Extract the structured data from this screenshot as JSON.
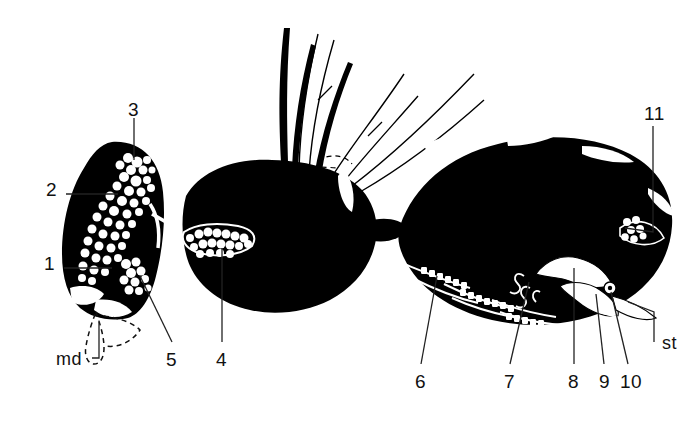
{
  "figure": {
    "background_color": "#ffffff",
    "ink_color": "#000000",
    "label_color": "#111111",
    "width": 698,
    "height": 425
  },
  "labels": [
    {
      "id": "label-1",
      "text": "1",
      "x": 44,
      "y": 262,
      "leader": "horizontal-right"
    },
    {
      "id": "label-2",
      "text": "2",
      "x": 46,
      "y": 188,
      "leader": "horizontal-right"
    },
    {
      "id": "label-3",
      "text": "3",
      "x": 128,
      "y": 106,
      "leader": "vertical-down"
    },
    {
      "id": "label-4",
      "text": "4",
      "x": 216,
      "y": 358,
      "leader": "vertical-up"
    },
    {
      "id": "label-5",
      "text": "5",
      "x": 166,
      "y": 358,
      "leader": "diagonal-up-right"
    },
    {
      "id": "label-6",
      "text": "6",
      "x": 415,
      "y": 380,
      "leader": "diagonal-up-right"
    },
    {
      "id": "label-7",
      "text": "7",
      "x": 504,
      "y": 380,
      "leader": "diagonal-up-right"
    },
    {
      "id": "label-8",
      "text": "8",
      "x": 568,
      "y": 380,
      "leader": "vertical-up"
    },
    {
      "id": "label-9",
      "text": "9",
      "x": 600,
      "y": 380,
      "leader": "vertical-up"
    },
    {
      "id": "label-10",
      "text": "10",
      "x": 620,
      "y": 380,
      "leader": "vertical-up"
    },
    {
      "id": "label-11",
      "text": "11",
      "x": 645,
      "y": 108,
      "leader": "bent-down-left"
    },
    {
      "id": "label-md",
      "text": "md",
      "x": 60,
      "y": 360,
      "leader": "bracket-up-right"
    },
    {
      "id": "label-st",
      "text": "st",
      "x": 664,
      "y": 340,
      "leader": "elbow-up-left"
    }
  ],
  "legend_note": {
    "numbered_count": 11,
    "lettered": [
      "md",
      "st"
    ]
  }
}
